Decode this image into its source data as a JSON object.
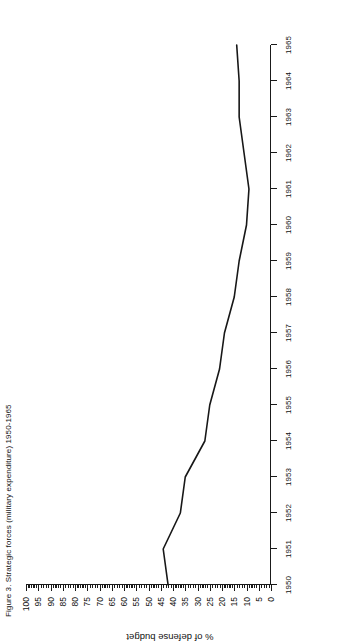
{
  "figure": {
    "title": "Figure 3. Strategic forces (military expenditure) 1950-1965",
    "background_color": "#ffffff",
    "line_color": "#171717",
    "orientation_note": "sideways"
  },
  "axes": {
    "x_label": "",
    "y_label": "% of defense budget",
    "x_tick_labels": [
      "1950",
      "1951",
      "1952",
      "1953",
      "1954",
      "1955",
      "1956",
      "1957",
      "1958",
      "1959",
      "1960",
      "1961",
      "1962",
      "1963",
      "1964",
      "1965"
    ],
    "y_tick_labels": [
      "0",
      "5",
      "10",
      "15",
      "20",
      "25",
      "30",
      "35",
      "40",
      "45",
      "50",
      "55",
      "60",
      "65",
      "70",
      "75",
      "80",
      "85",
      "90",
      "95",
      "100"
    ]
  },
  "chart_data": {
    "type": "line",
    "title": "Figure 3. Strategic forces (military expenditure) 1950-1965",
    "xlabel": "",
    "ylabel": "% of defense budget",
    "xlim": [
      1950,
      1965
    ],
    "ylim": [
      0,
      100
    ],
    "grid": false,
    "legend": "none",
    "x": [
      1950,
      1951,
      1952,
      1953,
      1954,
      1955,
      1956,
      1957,
      1958,
      1959,
      1960,
      1961,
      1962,
      1963,
      1964,
      1965
    ],
    "categories": [
      "1950",
      "1951",
      "1952",
      "1953",
      "1954",
      "1955",
      "1956",
      "1957",
      "1958",
      "1959",
      "1960",
      "1961",
      "1962",
      "1963",
      "1964",
      "1965"
    ],
    "values": [
      42,
      44,
      37,
      35,
      27,
      25,
      21,
      19,
      15,
      13,
      10,
      9,
      11,
      13,
      13,
      14
    ],
    "series": [
      {
        "name": "% of defense budget",
        "values": [
          42,
          44,
          37,
          35,
          27,
          25,
          21,
          19,
          15,
          13,
          10,
          9,
          11,
          13,
          13,
          14
        ]
      }
    ],
    "y_major_step": 5,
    "y_minor_step": 1,
    "x_major_step": 1
  }
}
